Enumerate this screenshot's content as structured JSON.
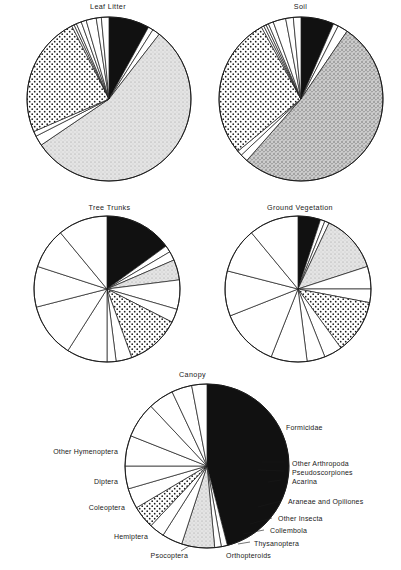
{
  "figure": {
    "background": "#ffffff",
    "ink": "#111111"
  },
  "categories": [
    {
      "key": "acarina",
      "label": "Acarina",
      "fill": "light-stipple",
      "color": "#d8d8d8"
    },
    {
      "key": "collembola",
      "label": "Collembola",
      "fill": "dotted",
      "color": "#ffffff"
    },
    {
      "key": "formicidae",
      "label": "Formicidae",
      "fill": "solid-black",
      "color": "#111111"
    },
    {
      "key": "other_hymenoptera",
      "label": "Other Hymenoptera",
      "fill": "white",
      "color": "#ffffff"
    },
    {
      "key": "diptera",
      "label": "Diptera",
      "fill": "white",
      "color": "#ffffff"
    },
    {
      "key": "coleoptera",
      "label": "Coleoptera",
      "fill": "white",
      "color": "#ffffff"
    },
    {
      "key": "hemiptera",
      "label": "Hemiptera",
      "fill": "white",
      "color": "#ffffff"
    },
    {
      "key": "psocoptera",
      "label": "Psocoptera",
      "fill": "white",
      "color": "#ffffff"
    },
    {
      "key": "orthopteroids",
      "label": "Orthopteroids",
      "fill": "white",
      "color": "#ffffff"
    },
    {
      "key": "thysanoptera",
      "label": "Thysanoptera",
      "fill": "white",
      "color": "#ffffff"
    },
    {
      "key": "other_insecta",
      "label": "Other Insecta",
      "fill": "white",
      "color": "#ffffff"
    },
    {
      "key": "araneae",
      "label": "Araneae and Opiliones",
      "fill": "white",
      "color": "#ffffff"
    },
    {
      "key": "pseudoscorpiones",
      "label": "Pseudoscorpiones",
      "fill": "white",
      "color": "#ffffff"
    },
    {
      "key": "other_arthropoda",
      "label": "Other Arthropoda",
      "fill": "white",
      "color": "#ffffff"
    }
  ],
  "panels": {
    "leaf_litter": {
      "title": "Leaf Litter"
    },
    "soil": {
      "title": "Soil"
    },
    "tree_trunks": {
      "title": "Tree Trunks"
    },
    "ground_vegetation": {
      "title": "Ground Vegetation"
    },
    "canopy": {
      "title": "Canopy"
    }
  },
  "canopy_labels": {
    "formicidae": "Formicidae",
    "other_arthropoda": "Other Arthropoda",
    "pseudoscorpiones": "Pseudoscorpiones",
    "acarina": "Acarina",
    "araneae": "Araneae and Opiliones",
    "other_insecta": "Other Insecta",
    "collembola": "Collembola",
    "thysanoptera": "Thysanoptera",
    "orthopteroids": "Orthopteroids",
    "psocoptera": "Psocoptera",
    "hemiptera": "Hemiptera",
    "coleoptera": "Coleoptera",
    "diptera": "Diptera",
    "other_hymenoptera": "Other Hymenoptera"
  },
  "chart_data": {
    "type": "pie",
    "legend_position": "labelled-on-canopy-panel",
    "grid": false,
    "units": "percent of individuals",
    "start_angle_deg": 0,
    "direction": "clockwise",
    "categories": [
      "Formicidae",
      "Other Arthropoda",
      "Pseudoscorpiones",
      "Acarina",
      "Araneae and Opiliones",
      "Other Insecta",
      "Collembola",
      "Thysanoptera",
      "Orthopteroids",
      "Psocoptera",
      "Hemiptera",
      "Coleoptera",
      "Diptera",
      "Other Hymenoptera"
    ],
    "series": [
      {
        "name": "Leaf Litter",
        "values": [
          8.0,
          1.0,
          1.5,
          55.0,
          2.0,
          1.0,
          24.0,
          0.5,
          0.5,
          1.0,
          1.0,
          2.0,
          1.0,
          1.5
        ]
      },
      {
        "name": "Soil",
        "values": [
          6.5,
          1.0,
          2.0,
          52.0,
          1.5,
          1.0,
          28.0,
          0.5,
          0.5,
          0.5,
          1.0,
          2.5,
          1.5,
          1.5
        ]
      },
      {
        "name": "Tree Trunks",
        "values": [
          15.0,
          1.5,
          2.0,
          4.5,
          6.5,
          3.0,
          12.0,
          3.5,
          2.0,
          9.0,
          12.0,
          9.0,
          9.0,
          11.0
        ]
      },
      {
        "name": "Ground Vegetation",
        "values": [
          5.0,
          1.0,
          1.0,
          13.0,
          5.0,
          3.0,
          12.0,
          4.0,
          4.0,
          8.0,
          13.0,
          10.0,
          10.0,
          11.0
        ]
      },
      {
        "name": "Canopy",
        "values": [
          46.0,
          1.2,
          1.3,
          6.5,
          4.0,
          3.0,
          4.5,
          4.0,
          4.5,
          6.0,
          7.0,
          5.0,
          4.0,
          3.0
        ]
      }
    ]
  }
}
